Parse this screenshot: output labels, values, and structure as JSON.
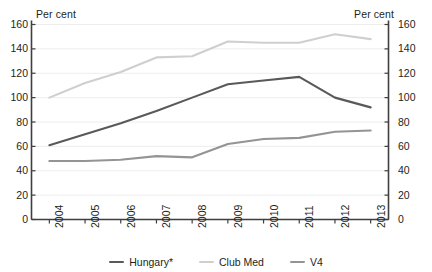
{
  "axes": {
    "left_unit": "Per cent",
    "right_unit": "Per cent"
  },
  "legend": {
    "items": [
      {
        "label": "Hungary*",
        "color": "#595959"
      },
      {
        "label": "Club Med",
        "color": "#cfcfcf"
      },
      {
        "label": "V4",
        "color": "#949494"
      }
    ]
  },
  "chart_data": {
    "type": "line",
    "title": "",
    "subtitle": "",
    "xlabel": "",
    "ylabel": "Per cent",
    "y2label": "Per cent",
    "ylim": [
      0,
      160
    ],
    "y2lim": [
      0,
      160
    ],
    "yticks": [
      0,
      20,
      40,
      60,
      80,
      100,
      120,
      140,
      160
    ],
    "y2ticks": [
      0,
      20,
      40,
      60,
      80,
      100,
      120,
      140,
      160
    ],
    "grid": true,
    "legend_position": "bottom",
    "categories": [
      "2004",
      "2005",
      "2006",
      "2007",
      "2008",
      "2009",
      "2010",
      "2011",
      "2012",
      "2013"
    ],
    "series": [
      {
        "name": "Hungary*",
        "color": "#595959",
        "values": [
          61,
          70,
          79,
          89,
          100,
          111,
          114,
          117,
          100,
          92
        ]
      },
      {
        "name": "Club Med",
        "color": "#cfcfcf",
        "values": [
          100,
          112,
          121,
          133,
          134,
          146,
          145,
          145,
          152,
          148
        ]
      },
      {
        "name": "V4",
        "color": "#949494",
        "values": [
          48,
          48,
          49,
          52,
          51,
          62,
          66,
          67,
          72,
          73
        ]
      }
    ]
  }
}
